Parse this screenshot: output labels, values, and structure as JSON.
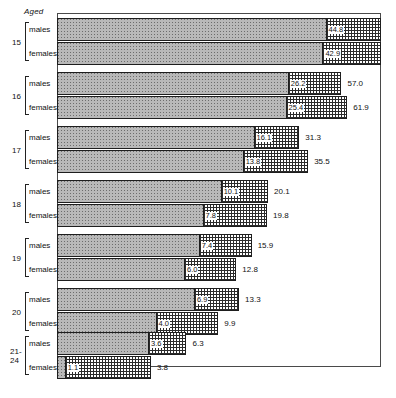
{
  "header": {
    "aged_label": "Aged"
  },
  "axis": {
    "scale": "log",
    "min": 1,
    "max": 100,
    "ticks": [
      1,
      2,
      3,
      4,
      5,
      6,
      7,
      8,
      9,
      10,
      20,
      30,
      40,
      50,
      60,
      70,
      80,
      90
    ],
    "labeled_ticks": [
      "1",
      "2",
      "3",
      "4",
      "5",
      "6",
      "7",
      "8",
      "9",
      "10",
      "20",
      "30",
      "40",
      "50",
      "60",
      "70",
      "80",
      "90"
    ]
  },
  "series_labels": {
    "male": "males",
    "female": "females"
  },
  "chart_data": {
    "type": "bar",
    "orientation": "horizontal",
    "stacked": true,
    "title": "",
    "xlabel": "",
    "ylabel": "Aged",
    "xscale": "log",
    "xlim": [
      1,
      100
    ],
    "grid": false,
    "legend": "none",
    "categories": [
      "15",
      "16",
      "17",
      "18",
      "19",
      "20",
      "21-24"
    ],
    "series": [
      {
        "name": "first segment",
        "pattern": "grey-dotted"
      },
      {
        "name": "second segment",
        "pattern": "cross-hatched"
      }
    ],
    "rows": [
      {
        "age": "15",
        "sex": "males",
        "segment": 44.8,
        "total": 100.0,
        "segment_label": "44.8",
        "total_label": ""
      },
      {
        "age": "15",
        "sex": "females",
        "segment": 42.9,
        "total": 100.0,
        "segment_label": "42.9",
        "total_label": ""
      },
      {
        "age": "16",
        "sex": "males",
        "segment": 26.2,
        "total": 57.0,
        "segment_label": "26.2",
        "total_label": "57.0"
      },
      {
        "age": "16",
        "sex": "females",
        "segment": 25.4,
        "total": 61.9,
        "segment_label": "25.4",
        "total_label": "61.9"
      },
      {
        "age": "17",
        "sex": "males",
        "segment": 16.1,
        "total": 31.3,
        "segment_label": "16.1",
        "total_label": "31.3"
      },
      {
        "age": "17",
        "sex": "females",
        "segment": 13.8,
        "total": 35.5,
        "segment_label": "13.8",
        "total_label": "35.5"
      },
      {
        "age": "18",
        "sex": "males",
        "segment": 10.1,
        "total": 20.1,
        "segment_label": "10.1",
        "total_label": "20.1"
      },
      {
        "age": "18",
        "sex": "females",
        "segment": 7.8,
        "total": 19.8,
        "segment_label": "7.8",
        "total_label": "19.8"
      },
      {
        "age": "19",
        "sex": "males",
        "segment": 7.4,
        "total": 15.9,
        "segment_label": "7.4",
        "total_label": "15.9"
      },
      {
        "age": "19",
        "sex": "females",
        "segment": 6.0,
        "total": 12.8,
        "segment_label": "6.0",
        "total_label": "12.8"
      },
      {
        "age": "20",
        "sex": "males",
        "segment": 6.9,
        "total": 13.3,
        "segment_label": "6.9",
        "total_label": "13.3"
      },
      {
        "age": "20",
        "sex": "females",
        "segment": 4.0,
        "total": 9.9,
        "segment_label": "4.0",
        "total_label": "9.9"
      },
      {
        "age": "21-24",
        "sex": "males",
        "segment": 3.6,
        "total": 6.3,
        "segment_label": "3.6",
        "total_label": "6.3"
      },
      {
        "age": "21-24",
        "sex": "females",
        "segment": 1.1,
        "total": 3.8,
        "segment_label": "1.1",
        "total_label": "3.8"
      }
    ]
  }
}
